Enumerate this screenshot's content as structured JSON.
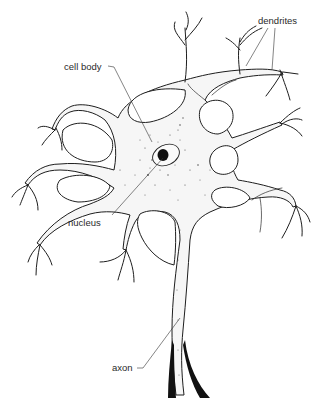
{
  "diagram": {
    "labels": {
      "dendrites": "dendrites",
      "cell_body": "cell body",
      "nucleus": "nucleus",
      "axon": "axon"
    },
    "colors": {
      "ink": "#1e1e1e",
      "background": "#ffffff",
      "stipple": "#555555"
    }
  }
}
